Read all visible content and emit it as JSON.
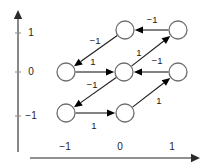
{
  "figure": {
    "width": 210,
    "height": 168,
    "background": "#ffffff"
  },
  "axes": {
    "x_axis": {
      "name": "x-axis",
      "line": {
        "x1": 30,
        "y1": 158,
        "x2": 192,
        "y2": 158
      },
      "arrow_tip": {
        "x": 200,
        "y": 158
      },
      "ticks": [
        {
          "label": "−1",
          "x": 65,
          "label_x": 65,
          "label_y": 147
        },
        {
          "label": "0",
          "x": 120,
          "label_x": 120,
          "label_y": 147
        },
        {
          "label": "1",
          "x": 172,
          "label_x": 172,
          "label_y": 147
        }
      ]
    },
    "y_axis": {
      "name": "y-axis",
      "line": {
        "x1": 18,
        "y1": 152,
        "x2": 18,
        "y2": 18
      },
      "arrow_tip": {
        "x": 18,
        "y": 10
      },
      "ticks": [
        {
          "label": "1",
          "y": 33,
          "label_x": 31,
          "label_y": 33
        },
        {
          "label": "0",
          "y": 72,
          "label_x": 31,
          "label_y": 72
        },
        {
          "label": "−1",
          "y": 116,
          "label_x": 31,
          "label_y": 116
        }
      ]
    },
    "axis_color": "#6b6b6b",
    "label_color": "#262626"
  },
  "graph": {
    "node_radius": 9,
    "node_fill": "#ffffff",
    "node_stroke": "#6e6e6e",
    "edge_color": "#1c1c1c",
    "nodes": [
      {
        "id": "n_top_mid",
        "name": "node-top-middle",
        "cx": 125,
        "cy": 30,
        "grid": [
          0,
          1
        ]
      },
      {
        "id": "n_top_right",
        "name": "node-top-right",
        "cx": 178,
        "cy": 30,
        "grid": [
          1,
          1
        ]
      },
      {
        "id": "n_mid_left",
        "name": "node-middle-left",
        "cx": 66,
        "cy": 72,
        "grid": [
          -1,
          0
        ]
      },
      {
        "id": "n_mid_mid",
        "name": "node-middle-middle",
        "cx": 124,
        "cy": 72,
        "grid": [
          0,
          0
        ]
      },
      {
        "id": "n_mid_right",
        "name": "node-middle-right",
        "cx": 178,
        "cy": 72,
        "grid": [
          1,
          0
        ]
      },
      {
        "id": "n_bot_left",
        "name": "node-bottom-left",
        "cx": 66,
        "cy": 113,
        "grid": [
          -1,
          -1
        ]
      },
      {
        "id": "n_bot_mid",
        "name": "node-bottom-middle",
        "cx": 125,
        "cy": 113,
        "grid": [
          0,
          -1
        ]
      }
    ],
    "edges": [
      {
        "id": "e1",
        "name": "edge-top-right-to-top-middle",
        "from": "n_top_right",
        "to": "n_top_mid",
        "label": "−1",
        "label_x": 152,
        "label_y": 20
      },
      {
        "id": "e2",
        "name": "edge-top-middle-to-middle-left",
        "from": "n_top_mid",
        "to": "n_mid_left",
        "label": "−1",
        "label_x": 95,
        "label_y": 41
      },
      {
        "id": "e3",
        "name": "edge-middle-left-to-middle-middle",
        "from": "n_mid_left",
        "to": "n_mid_mid",
        "label": "1",
        "label_x": 93,
        "label_y": 62
      },
      {
        "id": "e4",
        "name": "edge-middle-middle-to-top-right",
        "from": "n_mid_mid",
        "to": "n_top_right",
        "label": "1",
        "label_x": 139,
        "label_y": 53
      },
      {
        "id": "e5",
        "name": "edge-middle-right-to-middle-middle",
        "from": "n_mid_right",
        "to": "n_mid_mid",
        "label": "−1",
        "label_x": 157,
        "label_y": 61
      },
      {
        "id": "e6",
        "name": "edge-middle-middle-to-bottom-left",
        "from": "n_mid_mid",
        "to": "n_bot_left",
        "label": "−1",
        "label_x": 92,
        "label_y": 85
      },
      {
        "id": "e7",
        "name": "edge-bottom-left-to-bottom-middle",
        "from": "n_bot_left",
        "to": "n_bot_mid",
        "label": "1",
        "label_x": 94,
        "label_y": 126
      },
      {
        "id": "e8",
        "name": "edge-bottom-middle-to-middle-right",
        "from": "n_bot_mid",
        "to": "n_mid_right",
        "label": "1",
        "label_x": 159,
        "label_y": 101
      }
    ]
  }
}
